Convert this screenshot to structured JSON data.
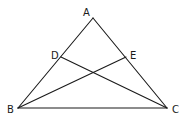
{
  "diagram": {
    "type": "triangle-with-cevians",
    "stroke_color": "#1a1a1a",
    "background": "#ffffff",
    "points": {
      "A": {
        "x": 93,
        "y": 18
      },
      "B": {
        "x": 18,
        "y": 108
      },
      "C": {
        "x": 167,
        "y": 108
      },
      "D": {
        "x": 61,
        "y": 57
      },
      "E": {
        "x": 126,
        "y": 57
      }
    },
    "labels": [
      {
        "text": "A",
        "x": 83,
        "y": 16
      },
      {
        "text": "D",
        "x": 51,
        "y": 59
      },
      {
        "text": "E",
        "x": 130,
        "y": 59
      },
      {
        "text": "B",
        "x": 7,
        "y": 113
      },
      {
        "text": "C",
        "x": 172,
        "y": 113
      }
    ],
    "segments": [
      {
        "name": "AB",
        "from": "A",
        "to": "B"
      },
      {
        "name": "AC",
        "from": "A",
        "to": "C"
      },
      {
        "name": "BC",
        "from": "B",
        "to": "C"
      },
      {
        "name": "DC",
        "from": "D",
        "to": "C"
      },
      {
        "name": "BE",
        "from": "B",
        "to": "E"
      }
    ]
  }
}
